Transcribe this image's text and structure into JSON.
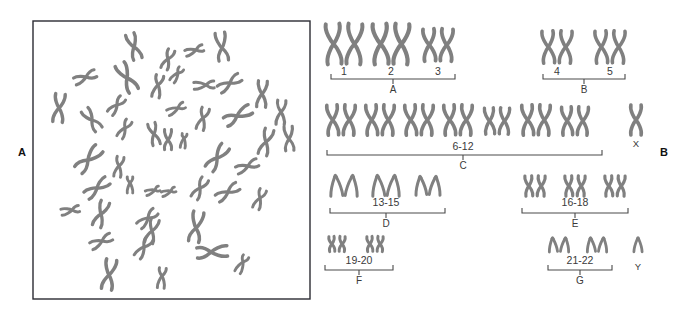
{
  "figure": {
    "panels": [
      {
        "id": "A",
        "label": "A",
        "label_x": 18,
        "label_y": 156,
        "caption": "metaphase-spread"
      },
      {
        "id": "B",
        "label": "B",
        "label_x": 660,
        "label_y": 156,
        "caption": "karyotype"
      }
    ]
  },
  "spread": {
    "name": "metaphase-chromosome-spread",
    "box": {
      "x": 33,
      "y": 21,
      "width": 277,
      "height": 278
    },
    "chromosome_count": 46,
    "chromosomes": [
      {
        "cx": 134,
        "cy": 47,
        "len": 26,
        "rot": -18,
        "arm": 0.52,
        "w": 3.4
      },
      {
        "cx": 168,
        "cy": 59,
        "len": 20,
        "rot": 22,
        "arm": 0.48,
        "w": 3.2
      },
      {
        "cx": 196,
        "cy": 50,
        "len": 18,
        "rot": 72,
        "arm": 0.4,
        "w": 3.0
      },
      {
        "cx": 222,
        "cy": 48,
        "len": 28,
        "rot": -8,
        "arm": 0.55,
        "w": 3.3
      },
      {
        "cx": 86,
        "cy": 77,
        "len": 22,
        "rot": 68,
        "arm": 0.46,
        "w": 3.2
      },
      {
        "cx": 127,
        "cy": 78,
        "len": 30,
        "rot": -28,
        "arm": 0.52,
        "w": 3.6
      },
      {
        "cx": 158,
        "cy": 85,
        "len": 22,
        "rot": 12,
        "arm": 0.44,
        "w": 3.2
      },
      {
        "cx": 206,
        "cy": 85,
        "len": 20,
        "rot": 86,
        "arm": 0.4,
        "w": 3.0
      },
      {
        "cx": 230,
        "cy": 83,
        "len": 24,
        "rot": 58,
        "arm": 0.48,
        "w": 3.2
      },
      {
        "cx": 262,
        "cy": 94,
        "len": 26,
        "rot": 4,
        "arm": 0.5,
        "w": 3.3
      },
      {
        "cx": 59,
        "cy": 108,
        "len": 28,
        "rot": 6,
        "arm": 0.5,
        "w": 3.4
      },
      {
        "cx": 117,
        "cy": 105,
        "len": 20,
        "rot": 40,
        "arm": 0.46,
        "w": 3.1
      },
      {
        "cx": 92,
        "cy": 120,
        "len": 24,
        "rot": -36,
        "arm": 0.52,
        "w": 3.3
      },
      {
        "cx": 178,
        "cy": 108,
        "len": 18,
        "rot": 64,
        "arm": 0.38,
        "w": 2.9
      },
      {
        "cx": 203,
        "cy": 118,
        "len": 22,
        "rot": 16,
        "arm": 0.46,
        "w": 3.1
      },
      {
        "cx": 237,
        "cy": 116,
        "len": 28,
        "rot": 62,
        "arm": 0.54,
        "w": 3.4
      },
      {
        "cx": 281,
        "cy": 112,
        "len": 24,
        "rot": 4,
        "arm": 0.48,
        "w": 3.2
      },
      {
        "cx": 125,
        "cy": 128,
        "len": 19,
        "rot": 30,
        "arm": 0.44,
        "w": 3.0
      },
      {
        "cx": 154,
        "cy": 134,
        "len": 22,
        "rot": -14,
        "arm": 0.5,
        "w": 3.1
      },
      {
        "cx": 184,
        "cy": 138,
        "len": 14,
        "rot": 8,
        "arm": 0.3,
        "w": 2.9
      },
      {
        "cx": 168,
        "cy": 140,
        "len": 20,
        "rot": 0,
        "arm": 0.52,
        "w": 3.1
      },
      {
        "cx": 266,
        "cy": 142,
        "len": 26,
        "rot": 16,
        "arm": 0.5,
        "w": 3.3
      },
      {
        "cx": 289,
        "cy": 139,
        "len": 24,
        "rot": -4,
        "arm": 0.52,
        "w": 3.2
      },
      {
        "cx": 88,
        "cy": 160,
        "len": 30,
        "rot": 44,
        "arm": 0.54,
        "w": 3.5
      },
      {
        "cx": 119,
        "cy": 166,
        "len": 20,
        "rot": 10,
        "arm": 0.46,
        "w": 3.0
      },
      {
        "cx": 217,
        "cy": 158,
        "len": 28,
        "rot": 36,
        "arm": 0.52,
        "w": 3.4
      },
      {
        "cx": 248,
        "cy": 166,
        "len": 22,
        "rot": 68,
        "arm": 0.46,
        "w": 3.1
      },
      {
        "cx": 97,
        "cy": 188,
        "len": 26,
        "rot": 54,
        "arm": 0.5,
        "w": 3.3
      },
      {
        "cx": 130,
        "cy": 183,
        "len": 16,
        "rot": 0,
        "arm": 0.38,
        "w": 2.9
      },
      {
        "cx": 155,
        "cy": 190,
        "len": 14,
        "rot": 70,
        "arm": 0.32,
        "w": 2.8
      },
      {
        "cx": 171,
        "cy": 191,
        "len": 14,
        "rot": 70,
        "arm": 0.32,
        "w": 2.8
      },
      {
        "cx": 200,
        "cy": 188,
        "len": 22,
        "rot": 30,
        "arm": 0.48,
        "w": 3.1
      },
      {
        "cx": 228,
        "cy": 192,
        "len": 24,
        "rot": 58,
        "arm": 0.48,
        "w": 3.2
      },
      {
        "cx": 260,
        "cy": 198,
        "len": 20,
        "rot": 22,
        "arm": 0.44,
        "w": 3.0
      },
      {
        "cx": 72,
        "cy": 210,
        "len": 18,
        "rot": 78,
        "arm": 0.4,
        "w": 2.9
      },
      {
        "cx": 101,
        "cy": 214,
        "len": 26,
        "rot": 20,
        "arm": 0.5,
        "w": 3.3
      },
      {
        "cx": 148,
        "cy": 218,
        "len": 22,
        "rot": 48,
        "arm": 0.46,
        "w": 3.1
      },
      {
        "cx": 152,
        "cy": 231,
        "len": 24,
        "rot": 16,
        "arm": 0.5,
        "w": 3.2
      },
      {
        "cx": 196,
        "cy": 228,
        "len": 30,
        "rot": 10,
        "arm": 0.54,
        "w": 3.5
      },
      {
        "cx": 102,
        "cy": 241,
        "len": 22,
        "rot": 64,
        "arm": 0.46,
        "w": 3.1
      },
      {
        "cx": 144,
        "cy": 247,
        "len": 22,
        "rot": 34,
        "arm": 0.46,
        "w": 3.1
      },
      {
        "cx": 211,
        "cy": 252,
        "len": 30,
        "rot": 86,
        "arm": 0.54,
        "w": 3.5
      },
      {
        "cx": 243,
        "cy": 262,
        "len": 18,
        "rot": 28,
        "arm": 0.36,
        "w": 2.9
      },
      {
        "cx": 109,
        "cy": 275,
        "len": 30,
        "rot": 10,
        "arm": 0.52,
        "w": 3.5
      },
      {
        "cx": 162,
        "cy": 276,
        "len": 20,
        "rot": 6,
        "arm": 0.4,
        "w": 3.0
      },
      {
        "cx": 178,
        "cy": 73,
        "len": 16,
        "rot": 36,
        "arm": 0.36,
        "w": 2.9
      }
    ]
  },
  "karyotype": {
    "name": "human-karyotype",
    "rows": [
      {
        "id": "row-1",
        "groups": [
          {
            "id": "group-A",
            "group_label": "A",
            "bracket": {
              "x1": 331,
              "x2": 455,
              "y": 79
            },
            "tick_x": 393,
            "numbers": [
              {
                "label": "1",
                "x": 344,
                "y": 75
              },
              {
                "label": "2",
                "x": 391,
                "y": 75
              },
              {
                "label": "3",
                "x": 438,
                "y": 75
              }
            ],
            "pairs": [
              {
                "cx": 344,
                "cy": 44,
                "len": 40,
                "w": 4.0
              },
              {
                "cx": 391,
                "cy": 44,
                "len": 40,
                "w": 4.2
              },
              {
                "cx": 438,
                "cy": 45,
                "len": 32,
                "w": 3.8
              }
            ]
          },
          {
            "id": "group-B",
            "group_label": "B",
            "bracket": {
              "x1": 543,
              "x2": 625,
              "y": 79
            },
            "tick_x": 584,
            "numbers": [
              {
                "label": "4",
                "x": 557,
                "y": 75
              },
              {
                "label": "5",
                "x": 610,
                "y": 75
              }
            ],
            "pairs": [
              {
                "cx": 557,
                "cy": 47,
                "len": 32,
                "w": 3.6
              },
              {
                "cx": 610,
                "cy": 47,
                "len": 32,
                "w": 3.6
              }
            ]
          }
        ]
      },
      {
        "id": "row-2",
        "groups": [
          {
            "id": "group-C",
            "group_label": "C",
            "bracket": {
              "x1": 327,
              "x2": 602,
              "y": 155
            },
            "tick_x": 463,
            "numbers": [
              {
                "label": "6-12",
                "x": 463,
                "y": 150
              }
            ],
            "pairs": [
              {
                "cx": 341,
                "cy": 120,
                "len": 30,
                "w": 3.6
              },
              {
                "cx": 380,
                "cy": 120,
                "len": 30,
                "w": 3.6
              },
              {
                "cx": 419,
                "cy": 120,
                "len": 30,
                "w": 3.6
              },
              {
                "cx": 458,
                "cy": 120,
                "len": 30,
                "w": 3.6
              },
              {
                "cx": 497,
                "cy": 121,
                "len": 26,
                "w": 3.4
              },
              {
                "cx": 536,
                "cy": 120,
                "len": 30,
                "w": 3.6
              },
              {
                "cx": 575,
                "cy": 121,
                "len": 28,
                "w": 3.5
              }
            ]
          }
        ],
        "sex_chromosome": {
          "id": "chromosome-X",
          "label": "X",
          "cx": 636,
          "cy": 120,
          "len": 30,
          "w": 3.6,
          "label_x": 636,
          "label_y": 147
        }
      },
      {
        "id": "row-3",
        "groups": [
          {
            "id": "group-D",
            "group_label": "D",
            "bracket": {
              "x1": 330,
              "x2": 445,
              "y": 213
            },
            "tick_x": 386,
            "numbers": [
              {
                "label": "13-15",
                "x": 386,
                "y": 206
              }
            ],
            "pairs": [
              {
                "cx": 344,
                "cy": 186,
                "len": 19,
                "w": 3.0,
                "type": "acrocentric"
              },
              {
                "cx": 386,
                "cy": 186,
                "len": 19,
                "w": 3.0,
                "type": "acrocentric"
              },
              {
                "cx": 428,
                "cy": 186,
                "len": 17,
                "w": 3.0,
                "type": "acrocentric"
              }
            ]
          },
          {
            "id": "group-E",
            "group_label": "E",
            "bracket": {
              "x1": 522,
              "x2": 628,
              "y": 213
            },
            "tick_x": 575,
            "numbers": [
              {
                "label": "16-18",
                "x": 575,
                "y": 206
              }
            ],
            "pairs": [
              {
                "cx": 535,
                "cy": 186,
                "len": 20,
                "w": 3.2
              },
              {
                "cx": 575,
                "cy": 186,
                "len": 20,
                "w": 3.2
              },
              {
                "cx": 615,
                "cy": 186,
                "len": 20,
                "w": 3.2
              }
            ]
          }
        ]
      },
      {
        "id": "row-4",
        "groups": [
          {
            "id": "group-F",
            "group_label": "F",
            "bracket": {
              "x1": 325,
              "x2": 393,
              "y": 270
            },
            "tick_x": 359,
            "numbers": [
              {
                "label": "19-20",
                "x": 359,
                "y": 264
              }
            ],
            "pairs": [
              {
                "cx": 337,
                "cy": 244,
                "len": 15,
                "w": 3.0
              },
              {
                "cx": 375,
                "cy": 244,
                "len": 15,
                "w": 3.0
              }
            ]
          },
          {
            "id": "group-G",
            "group_label": "G",
            "bracket": {
              "x1": 548,
              "x2": 612,
              "y": 270
            },
            "tick_x": 580,
            "numbers": [
              {
                "label": "21-22",
                "x": 580,
                "y": 264
              }
            ],
            "pairs": [
              {
                "cx": 559,
                "cy": 245,
                "len": 13,
                "w": 2.8,
                "type": "acrocentric"
              },
              {
                "cx": 597,
                "cy": 245,
                "len": 13,
                "w": 2.8,
                "type": "acrocentric"
              }
            ]
          }
        ],
        "sex_chromosome": {
          "id": "chromosome-Y",
          "label": "Y",
          "cx": 638,
          "cy": 245,
          "len": 13,
          "w": 2.8,
          "type": "acrocentric",
          "label_x": 638,
          "label_y": 270
        }
      }
    ]
  },
  "colors": {
    "chromosome": "#808080",
    "bracket": "#4a4a4a",
    "text": "#3a3a3a",
    "panel_label": "#111111",
    "box_border": "#2b2b33",
    "background": "#ffffff"
  }
}
